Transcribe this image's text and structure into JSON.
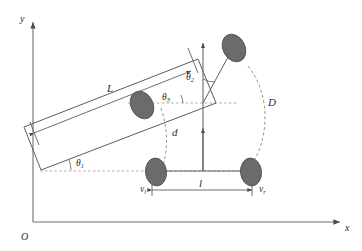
{
  "figure": {
    "kind": "differential-drive-robot-kinematics-diagram",
    "background_color": "#ffffff",
    "wheel_color": "#6b6b6b",
    "line_color": "#5d5d5d",
    "dashed_color": "#8a8a8a"
  },
  "axes": {
    "origin_label": "O",
    "y_label": "y",
    "x_label": "x"
  },
  "dimensions": {
    "body_length_label": "L",
    "wheel_track_label": "l",
    "offset_label": "d",
    "turn_radius_label": "D"
  },
  "angles": {
    "theta1": {
      "symbol": "θ",
      "subscript": "1",
      "text": "θ1"
    },
    "theta2": {
      "symbol": "θ",
      "subscript": "2",
      "text": "θ2"
    },
    "theta3": {
      "symbol": "θ",
      "subscript": "3",
      "text": "θ3"
    }
  },
  "velocities": {
    "left": {
      "symbol": "v",
      "subscript": "l",
      "text": "vl"
    },
    "right": {
      "symbol": "v",
      "subscript": "r",
      "text": "vr"
    }
  },
  "wheels": [
    {
      "name": "rear-left-wheel",
      "position": "bottom-left"
    },
    {
      "name": "rear-right-wheel",
      "position": "bottom-right"
    },
    {
      "name": "front-lower-wheel",
      "position": "middle"
    },
    {
      "name": "front-upper-wheel",
      "position": "top-right"
    }
  ]
}
